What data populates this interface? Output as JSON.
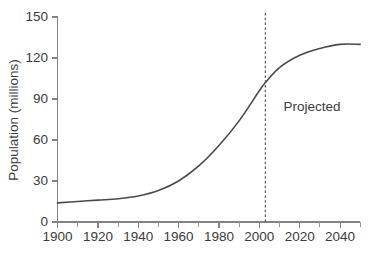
{
  "chart_data": {
    "type": "line",
    "title": "",
    "subtitle": "",
    "xlabel": "",
    "ylabel": "Population (millions)",
    "xlim": [
      1900,
      2050
    ],
    "ylim": [
      0,
      150
    ],
    "grid": false,
    "legend": false,
    "legend_position": "none",
    "x_ticks": [
      1900,
      1920,
      1940,
      1960,
      1980,
      2000,
      2020,
      2040
    ],
    "x_tick_labels": [
      "1900",
      "1920",
      "1940",
      "1960",
      "1980",
      "2000",
      "2020",
      "2040"
    ],
    "x_minor_tick_step": 10,
    "y_ticks": [
      0,
      30,
      60,
      90,
      120,
      150
    ],
    "y_tick_labels": [
      "0",
      "30",
      "60",
      "90",
      "120",
      "150"
    ],
    "series": [
      {
        "name": "Population",
        "color": "#4a4a4a",
        "x": [
          1900,
          1910,
          1920,
          1930,
          1940,
          1950,
          1960,
          1970,
          1980,
          1990,
          2000,
          2003,
          2010,
          2020,
          2030,
          2040,
          2050
        ],
        "values": [
          14,
          15,
          16,
          17,
          19,
          23,
          30,
          41,
          56,
          74,
          96,
          102,
          113,
          122,
          127,
          130,
          130
        ]
      }
    ],
    "annotations": [
      {
        "name": "projected-divider",
        "type": "vline",
        "x": 2003,
        "style": "dashed",
        "color": "#555555"
      },
      {
        "name": "projected-text",
        "type": "text",
        "text": "Projected",
        "x": 2012,
        "y": 84
      }
    ]
  }
}
